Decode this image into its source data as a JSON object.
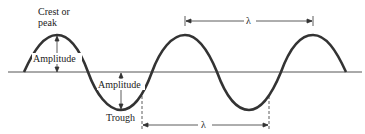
{
  "diagram": {
    "type": "transverse-wave",
    "labels": {
      "crest": "Crest or",
      "crest_line2": "peak",
      "amplitude_top": "Amplitude",
      "amplitude_bottom": "Amplitude",
      "trough": "Trough",
      "wavelength_top": "λ",
      "wavelength_bottom": "λ"
    },
    "colors": {
      "line": "#333333",
      "background": "#ffffff"
    }
  }
}
